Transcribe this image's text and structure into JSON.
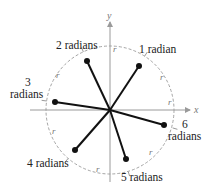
{
  "diagram": {
    "axes": {
      "x_label": "x",
      "y_label": "y"
    },
    "arc_label": "r",
    "points": [
      {
        "label": "1 radian"
      },
      {
        "label": "2 radians"
      },
      {
        "label_line1": "3",
        "label_line2": "radians"
      },
      {
        "label": "4 radians"
      },
      {
        "label": "5 radians"
      },
      {
        "label_line1": "6",
        "label_line2": "radians"
      }
    ]
  }
}
